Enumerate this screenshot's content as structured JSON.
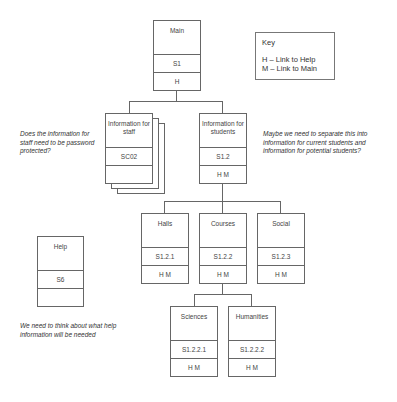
{
  "key": {
    "title": "Key",
    "items": [
      "H – Link to Help",
      "M – Link to Main"
    ]
  },
  "nodes": {
    "main": {
      "title": "Main",
      "code": "S1",
      "links": "H"
    },
    "staff": {
      "title": "Information for staff",
      "code": "SC02",
      "links": ""
    },
    "students": {
      "title": "Information for students",
      "code": "S1.2",
      "links": "H M"
    },
    "halls": {
      "title": "Halls",
      "code": "S1.2.1",
      "links": "H M"
    },
    "courses": {
      "title": "Courses",
      "code": "S1.2.2",
      "links": "H M"
    },
    "social": {
      "title": "Social",
      "code": "S1.2.3",
      "links": "H M"
    },
    "help": {
      "title": "Help",
      "code": "S6",
      "links": ""
    },
    "sciences": {
      "title": "Sciences",
      "code": "S1.2.2.1",
      "links": "H M"
    },
    "humanities": {
      "title": "Humanities",
      "code": "S1.2.2.2",
      "links": "H M"
    }
  },
  "notes": {
    "staff": "Does the information for staff need to be password protected?",
    "students": "Maybe we need to separate this into information for current students and information for potential students?",
    "help": "We need to think about what help information will be needed"
  }
}
